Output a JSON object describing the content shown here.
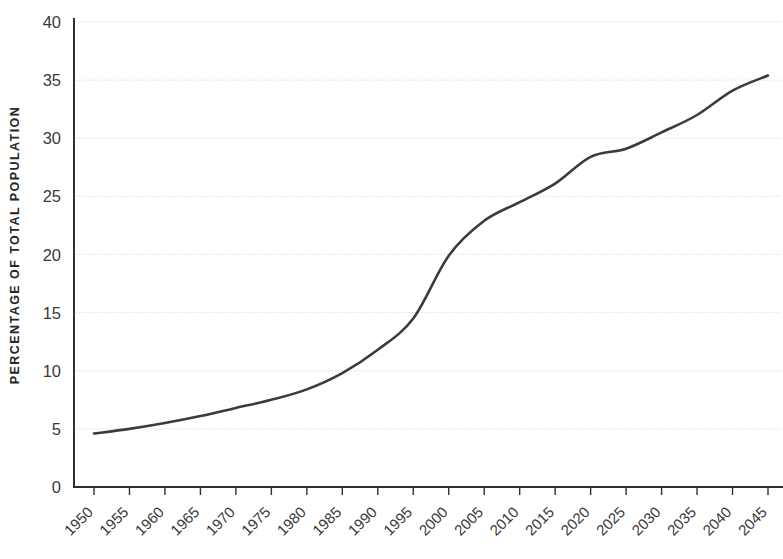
{
  "chart_data": {
    "type": "line",
    "title": "",
    "xlabel": "",
    "ylabel": "PERCENTAGE OF TOTAL POPULATION",
    "xlim": [
      1950,
      2045
    ],
    "ylim": [
      0,
      40
    ],
    "grid": true,
    "legend": "none",
    "y_ticks": [
      "0",
      "5",
      "10",
      "15",
      "20",
      "25",
      "30",
      "35",
      "40"
    ],
    "y_tick_values": [
      0,
      5,
      10,
      15,
      20,
      25,
      30,
      35,
      40
    ],
    "categories": [
      "1950",
      "1955",
      "1960",
      "1965",
      "1970",
      "1975",
      "1980",
      "1985",
      "1990",
      "1995",
      "2000",
      "2005",
      "2010",
      "2015",
      "2020",
      "2025",
      "2030",
      "2035",
      "2040",
      "2045"
    ],
    "x": [
      1950,
      1955,
      1960,
      1965,
      1970,
      1975,
      1980,
      1985,
      1990,
      1995,
      2000,
      2005,
      2010,
      2015,
      2020,
      2025,
      2030,
      2035,
      2040,
      2045
    ],
    "values": [
      4.6,
      5.0,
      5.5,
      6.1,
      6.8,
      7.5,
      8.4,
      9.8,
      11.8,
      14.5,
      19.9,
      22.9,
      24.5,
      26.1,
      28.4,
      29.1,
      30.5,
      32.0,
      34.1,
      35.4
    ],
    "series": [
      {
        "name": "Percentage of total population",
        "color": "#3b3b3b",
        "values": [
          4.6,
          5.0,
          5.5,
          6.1,
          6.8,
          7.5,
          8.4,
          9.8,
          11.8,
          14.5,
          19.9,
          22.9,
          24.5,
          26.1,
          28.4,
          29.1,
          30.5,
          32.0,
          34.1,
          35.4
        ]
      }
    ]
  }
}
